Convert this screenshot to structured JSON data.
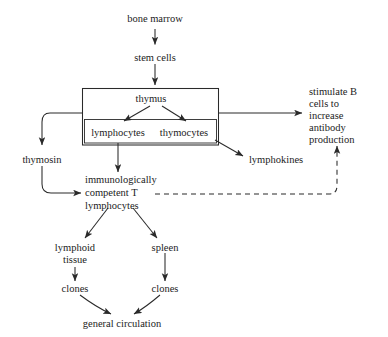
{
  "diagram": {
    "background_color": "#ffffff",
    "line_color": "#2a2a2a",
    "text_color": "#1c1c1c",
    "nodes": {
      "bone_marrow": "bone marrow",
      "stem_cells": "stem cells",
      "thymus": "thymus",
      "lymphocytes": "lymphocytes",
      "thymocytes": "thymocytes",
      "thymosin": "thymosin",
      "lymphokines": "lymphokines",
      "competent_line1": "immunologically",
      "competent_line2": "competent T",
      "competent_line3": "lymphocytes",
      "stimulate_line1": "stimulate B",
      "stimulate_line2": "cells to",
      "stimulate_line3": "increase",
      "stimulate_line4": "antibody",
      "stimulate_line5": "production",
      "lymphoid_line1": "lymphoid",
      "lymphoid_line2": "tissue",
      "spleen": "spleen",
      "clones_left": "clones",
      "clones_right": "clones",
      "general_circulation": "general circulation"
    }
  }
}
